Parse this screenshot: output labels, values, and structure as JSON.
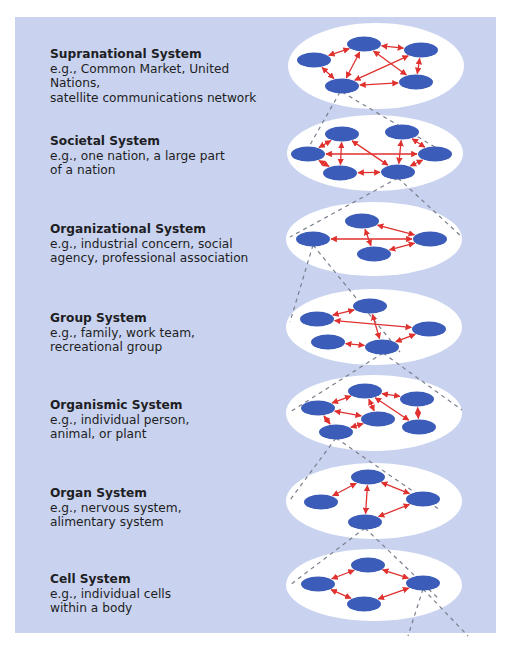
{
  "diagram": {
    "type": "hierarchy-of-living-systems",
    "colors": {
      "background": "#c9d3ef",
      "ellipse": "#ffffff",
      "node": "#3b5cb8",
      "arrow": "#e0312f",
      "dashed_line": "#7a7f8c",
      "text": "#1e1e24"
    },
    "levels": [
      {
        "title": "Supranational System",
        "description": "e.g., Common Market, United Nations,\nsatellite communications network",
        "text_top": 47,
        "ellipse": {
          "cx": 376,
          "cy": 66,
          "rx": 88,
          "ry": 43
        },
        "nodes": [
          [
            314,
            60
          ],
          [
            364,
            44
          ],
          [
            421,
            50
          ],
          [
            342,
            86
          ],
          [
            416,
            82
          ]
        ],
        "edges": [
          [
            0,
            1
          ],
          [
            0,
            3
          ],
          [
            1,
            2
          ],
          [
            1,
            3
          ],
          [
            1,
            4
          ],
          [
            2,
            3
          ],
          [
            2,
            4
          ],
          [
            3,
            4
          ]
        ]
      },
      {
        "title": "Societal System",
        "description": "e.g., one nation, a large part\nof a nation",
        "text_top": 134,
        "ellipse": {
          "cx": 375,
          "cy": 153,
          "rx": 88,
          "ry": 38
        },
        "nodes": [
          [
            308,
            154
          ],
          [
            342,
            134
          ],
          [
            402,
            132
          ],
          [
            340,
            173
          ],
          [
            398,
            172
          ],
          [
            435,
            154
          ]
        ],
        "edges": [
          [
            0,
            5
          ],
          [
            0,
            1
          ],
          [
            0,
            3
          ],
          [
            1,
            3
          ],
          [
            1,
            4
          ],
          [
            3,
            4
          ],
          [
            2,
            4
          ],
          [
            2,
            5
          ],
          [
            4,
            5
          ]
        ]
      },
      {
        "title": "Organizational System",
        "description": "e.g., industrial concern, social\nagency, professional association",
        "text_top": 222,
        "ellipse": {
          "cx": 374,
          "cy": 239,
          "rx": 88,
          "ry": 37
        },
        "nodes": [
          [
            313,
            239
          ],
          [
            362,
            221
          ],
          [
            430,
            239
          ],
          [
            374,
            254
          ]
        ],
        "edges": [
          [
            0,
            2
          ],
          [
            1,
            2
          ],
          [
            1,
            3
          ],
          [
            3,
            2
          ]
        ]
      },
      {
        "title": "Group System",
        "description": "e.g., family, work team,\nrecreational group",
        "text_top": 311,
        "ellipse": {
          "cx": 374,
          "cy": 327,
          "rx": 88,
          "ry": 38
        },
        "nodes": [
          [
            317,
            319
          ],
          [
            370,
            306
          ],
          [
            429,
            329
          ],
          [
            328,
            342
          ],
          [
            382,
            347
          ]
        ],
        "edges": [
          [
            0,
            1
          ],
          [
            0,
            2
          ],
          [
            1,
            4
          ],
          [
            3,
            4
          ],
          [
            4,
            2
          ]
        ]
      },
      {
        "title": "Organismic System",
        "description": "e.g., individual person,\nanimal, or plant",
        "text_top": 398,
        "ellipse": {
          "cx": 374,
          "cy": 413,
          "rx": 88,
          "ry": 38
        },
        "nodes": [
          [
            318,
            408
          ],
          [
            365,
            391
          ],
          [
            417,
            399
          ],
          [
            378,
            419
          ],
          [
            336,
            432
          ],
          [
            419,
            427
          ]
        ],
        "edges": [
          [
            0,
            1
          ],
          [
            1,
            2
          ],
          [
            1,
            3
          ],
          [
            1,
            5
          ],
          [
            0,
            3
          ],
          [
            0,
            4
          ],
          [
            4,
            3
          ],
          [
            2,
            5
          ]
        ]
      },
      {
        "title": "Organ System",
        "description": "e.g., nervous system,\nalimentary system",
        "text_top": 486,
        "ellipse": {
          "cx": 374,
          "cy": 501,
          "rx": 88,
          "ry": 38
        },
        "nodes": [
          [
            321,
            502
          ],
          [
            368,
            477
          ],
          [
            423,
            499
          ],
          [
            365,
            522
          ]
        ],
        "edges": [
          [
            0,
            1
          ],
          [
            1,
            3
          ],
          [
            1,
            2
          ],
          [
            2,
            3
          ]
        ]
      },
      {
        "title": "Cell System",
        "description": "e.g., individual cells\nwithin a body",
        "text_top": 572,
        "ellipse": {
          "cx": 374,
          "cy": 585,
          "rx": 88,
          "ry": 36
        },
        "nodes": [
          [
            318,
            584
          ],
          [
            368,
            565
          ],
          [
            423,
            583
          ],
          [
            364,
            604
          ]
        ],
        "edges": [
          [
            0,
            1
          ],
          [
            1,
            2
          ],
          [
            0,
            3
          ],
          [
            3,
            2
          ]
        ]
      }
    ],
    "connectors": [
      [
        [
          340,
          92
        ],
        [
          306,
          152
        ]
      ],
      [
        [
          342,
          92
        ],
        [
          440,
          150
        ]
      ],
      [
        [
          398,
          178
        ],
        [
          290,
          237
        ]
      ],
      [
        [
          398,
          178
        ],
        [
          462,
          237
        ]
      ],
      [
        [
          313,
          245
        ],
        [
          290,
          322
        ]
      ],
      [
        [
          313,
          245
        ],
        [
          400,
          352
        ]
      ],
      [
        [
          383,
          353
        ],
        [
          290,
          412
        ]
      ],
      [
        [
          383,
          353
        ],
        [
          462,
          410
        ]
      ],
      [
        [
          336,
          438
        ],
        [
          290,
          500
        ]
      ],
      [
        [
          336,
          438
        ],
        [
          440,
          510
        ]
      ],
      [
        [
          365,
          528
        ],
        [
          290,
          585
        ]
      ],
      [
        [
          365,
          528
        ],
        [
          440,
          600
        ]
      ],
      [
        [
          423,
          589
        ],
        [
          408,
          636
        ]
      ],
      [
        [
          423,
          589
        ],
        [
          468,
          636
        ]
      ]
    ]
  }
}
